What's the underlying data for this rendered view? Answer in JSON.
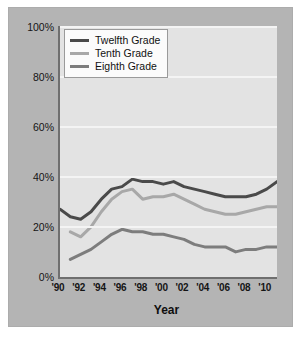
{
  "figure": {
    "background_color": "#b4b4b4",
    "plot_background_color": "#e3e3e3",
    "gridline_color": "#f4f4f4",
    "axis_color": "#6f6f6f"
  },
  "legend": {
    "position": "top-left",
    "entries": [
      {
        "label": "Twelfth Grade",
        "color": "#4a4a4a"
      },
      {
        "label": "Tenth Grade",
        "color": "#a8a8a8"
      },
      {
        "label": "Eighth Grade",
        "color": "#7d7d7d"
      }
    ]
  },
  "axes": {
    "y_ticks": [
      "0%",
      "20%",
      "40%",
      "60%",
      "80%",
      "100%"
    ],
    "x_ticks": [
      "'90",
      "'92",
      "'94",
      "'96",
      "'98",
      "'00",
      "'02",
      "'04",
      "'06",
      "'08",
      "'10"
    ],
    "x_title": "Year"
  },
  "chart_data": {
    "type": "line",
    "title": "",
    "subtitle": "",
    "xlabel": "Year",
    "ylabel": "",
    "xlim": [
      1990,
      2011
    ],
    "ylim": [
      0,
      100
    ],
    "ytick_values": [
      0,
      20,
      40,
      60,
      80,
      100
    ],
    "ytick_labels": [
      "0%",
      "20%",
      "40%",
      "60%",
      "80%",
      "100%"
    ],
    "xtick_values": [
      1990,
      1992,
      1994,
      1996,
      1998,
      2000,
      2002,
      2004,
      2006,
      2008,
      2010
    ],
    "xtick_labels": [
      "'90",
      "'92",
      "'94",
      "'96",
      "'98",
      "'00",
      "'02",
      "'04",
      "'06",
      "'08",
      "'10"
    ],
    "grid": "horizontal",
    "legend_position": "upper left",
    "x": [
      1990,
      1991,
      1992,
      1993,
      1994,
      1995,
      1996,
      1997,
      1998,
      1999,
      2000,
      2001,
      2002,
      2003,
      2004,
      2005,
      2006,
      2007,
      2008,
      2009,
      2010,
      2011
    ],
    "series": [
      {
        "name": "Twelfth Grade",
        "color": "#4a4a4a",
        "x": [
          1990,
          1991,
          1992,
          1993,
          1994,
          1995,
          1996,
          1997,
          1998,
          1999,
          2000,
          2001,
          2002,
          2003,
          2004,
          2005,
          2006,
          2007,
          2008,
          2009,
          2010,
          2011
        ],
        "values": [
          27,
          24,
          23,
          26,
          31,
          35,
          36,
          39,
          38,
          38,
          37,
          38,
          36,
          35,
          34,
          33,
          32,
          32,
          32,
          33,
          35,
          38
        ]
      },
      {
        "name": "Tenth Grade",
        "color": "#a8a8a8",
        "x": [
          1991,
          1992,
          1993,
          1994,
          1995,
          1996,
          1997,
          1998,
          1999,
          2000,
          2001,
          2002,
          2003,
          2004,
          2005,
          2006,
          2007,
          2008,
          2009,
          2010,
          2011
        ],
        "values": [
          18,
          16,
          20,
          26,
          31,
          34,
          35,
          31,
          32,
          32,
          33,
          31,
          29,
          27,
          26,
          25,
          25,
          26,
          27,
          28,
          28
        ]
      },
      {
        "name": "Eighth Grade",
        "color": "#7d7d7d",
        "x": [
          1991,
          1992,
          1993,
          1994,
          1995,
          1996,
          1997,
          1998,
          1999,
          2000,
          2001,
          2002,
          2003,
          2004,
          2005,
          2006,
          2007,
          2008,
          2009,
          2010,
          2011
        ],
        "values": [
          7,
          9,
          11,
          14,
          17,
          19,
          18,
          18,
          17,
          17,
          16,
          15,
          13,
          12,
          12,
          12,
          10,
          11,
          11,
          12,
          12
        ]
      }
    ]
  }
}
